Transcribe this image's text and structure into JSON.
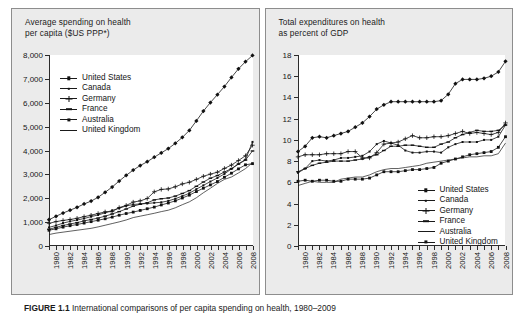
{
  "figure": {
    "caption_label": "FIGURE 1.1",
    "caption_text": "International comparisons of per capita spending on health, 1980–2009"
  },
  "panels": [
    {
      "id": "left",
      "title": "Average spending on health\nper capita ($US PPP*)"
    },
    {
      "id": "right",
      "title": "Total expenditures on health\nas percent of GDP"
    }
  ],
  "legend_entries": [
    "United States",
    "Canada",
    "Germany",
    "France",
    "Australia",
    "United Kingdom"
  ],
  "chart_data": [
    {
      "type": "line",
      "panel": "left",
      "title": "Average spending on health per capita ($US PPP*)",
      "xlabel": "",
      "ylabel": "",
      "xlim": [
        1980,
        2009
      ],
      "ylim": [
        0,
        8000
      ],
      "ytick_labels": [
        "0",
        "1,000",
        "2,000",
        "3,000",
        "4,000",
        "5,000",
        "6,000",
        "7,000",
        "8,000"
      ],
      "ytick_values": [
        0,
        1000,
        2000,
        3000,
        4000,
        5000,
        6000,
        7000,
        8000
      ],
      "xtick_labels": [
        "1980",
        "1982",
        "1984",
        "1986",
        "1988",
        "1990",
        "1992",
        "1994",
        "1996",
        "1998",
        "2000",
        "2002",
        "2004",
        "2006",
        "2008"
      ],
      "xtick_values": [
        1980,
        1982,
        1984,
        1986,
        1988,
        1990,
        1992,
        1994,
        1996,
        1998,
        2000,
        2002,
        2004,
        2006,
        2008
      ],
      "grid": false,
      "legend_position": "upper-left",
      "x": [
        1980,
        1981,
        1982,
        1983,
        1984,
        1985,
        1986,
        1987,
        1988,
        1989,
        1990,
        1991,
        1992,
        1993,
        1994,
        1995,
        1996,
        1997,
        1998,
        1999,
        2000,
        2001,
        2002,
        2003,
        2004,
        2005,
        2006,
        2007,
        2008,
        2009
      ],
      "series": [
        {
          "name": "United States",
          "marker": "diamond",
          "values": [
            1102,
            1245,
            1380,
            1500,
            1620,
            1760,
            1880,
            2040,
            2250,
            2470,
            2720,
            2960,
            3180,
            3370,
            3530,
            3720,
            3900,
            4080,
            4300,
            4550,
            4840,
            5240,
            5650,
            6010,
            6340,
            6680,
            7060,
            7420,
            7720,
            7980
          ]
        },
        {
          "name": "Canada",
          "marker": "small-square",
          "values": [
            780,
            860,
            960,
            1030,
            1090,
            1150,
            1230,
            1300,
            1390,
            1490,
            1580,
            1680,
            1740,
            1760,
            1780,
            1810,
            1830,
            1890,
            1980,
            2090,
            2210,
            2380,
            2540,
            2700,
            2850,
            3020,
            3230,
            3440,
            3620,
            4360
          ]
        },
        {
          "name": "Germany",
          "marker": "plus",
          "values": [
            950,
            1020,
            1070,
            1110,
            1160,
            1230,
            1290,
            1360,
            1430,
            1440,
            1610,
            1700,
            1840,
            1890,
            1990,
            2270,
            2370,
            2390,
            2480,
            2600,
            2670,
            2790,
            2920,
            3010,
            3090,
            3250,
            3390,
            3580,
            3780,
            4220
          ]
        },
        {
          "name": "France",
          "marker": "dash",
          "values": [
            700,
            780,
            860,
            920,
            980,
            1050,
            1110,
            1170,
            1250,
            1340,
            1440,
            1550,
            1670,
            1750,
            1810,
            1930,
            1980,
            2010,
            2090,
            2200,
            2320,
            2500,
            2680,
            2840,
            2950,
            3100,
            3240,
            3430,
            3600,
            3980
          ]
        },
        {
          "name": "Australia",
          "marker": "square",
          "values": [
            660,
            720,
            790,
            850,
            900,
            960,
            1020,
            1080,
            1140,
            1210,
            1290,
            1360,
            1420,
            1490,
            1560,
            1630,
            1720,
            1800,
            1890,
            2010,
            2130,
            2280,
            2420,
            2560,
            2700,
            2880,
            3050,
            3230,
            3400,
            3450
          ]
        },
        {
          "name": "United Kingdom",
          "marker": "line",
          "values": [
            480,
            540,
            580,
            620,
            660,
            700,
            740,
            800,
            870,
            940,
            1010,
            1090,
            1190,
            1250,
            1310,
            1370,
            1440,
            1500,
            1600,
            1730,
            1850,
            2020,
            2230,
            2420,
            2620,
            2790,
            2890,
            3060,
            3240,
            3490
          ]
        }
      ]
    },
    {
      "type": "line",
      "panel": "right",
      "title": "Total expenditures on health as percent of GDP",
      "xlabel": "",
      "ylabel": "",
      "xlim": [
        1980,
        2009
      ],
      "ylim": [
        0,
        18
      ],
      "ytick_labels": [
        "0",
        "2",
        "4",
        "6",
        "8",
        "10",
        "12",
        "14",
        "16",
        "18"
      ],
      "ytick_values": [
        0,
        2,
        4,
        6,
        8,
        10,
        12,
        14,
        16,
        18
      ],
      "xtick_labels": [
        "1980",
        "1982",
        "1984",
        "1986",
        "1988",
        "1990",
        "1992",
        "1994",
        "1996",
        "1998",
        "2000",
        "2002",
        "2004",
        "2006",
        "2008"
      ],
      "xtick_values": [
        1980,
        1982,
        1984,
        1986,
        1988,
        1990,
        1992,
        1994,
        1996,
        1998,
        2000,
        2002,
        2004,
        2006,
        2008
      ],
      "grid": false,
      "legend_position": "lower-right",
      "x": [
        1980,
        1981,
        1982,
        1983,
        1984,
        1985,
        1986,
        1987,
        1988,
        1989,
        1990,
        1991,
        1992,
        1993,
        1994,
        1995,
        1996,
        1997,
        1998,
        1999,
        2000,
        2001,
        2002,
        2003,
        2004,
        2005,
        2006,
        2007,
        2008,
        2009
      ],
      "series": [
        {
          "name": "United States",
          "marker": "diamond",
          "values": [
            8.9,
            9.4,
            10.2,
            10.3,
            10.2,
            10.4,
            10.6,
            10.8,
            11.2,
            11.6,
            12.2,
            12.9,
            13.3,
            13.6,
            13.6,
            13.6,
            13.6,
            13.6,
            13.6,
            13.6,
            13.7,
            14.3,
            15.3,
            15.7,
            15.7,
            15.7,
            15.8,
            16.0,
            16.4,
            17.4
          ]
        },
        {
          "name": "Canada",
          "marker": "small-square",
          "values": [
            6.9,
            7.3,
            8.0,
            8.1,
            8.0,
            8.1,
            8.3,
            8.3,
            8.4,
            8.5,
            8.9,
            9.6,
            9.9,
            9.7,
            9.5,
            9.0,
            8.8,
            8.8,
            8.9,
            8.9,
            8.8,
            9.3,
            9.6,
            9.8,
            9.8,
            9.8,
            10.0,
            10.0,
            10.3,
            11.4
          ]
        },
        {
          "name": "Germany",
          "marker": "plus",
          "values": [
            8.4,
            8.6,
            8.6,
            8.6,
            8.7,
            8.7,
            8.7,
            8.9,
            8.9,
            8.3,
            8.3,
            8.8,
            9.6,
            9.7,
            9.8,
            10.1,
            10.4,
            10.2,
            10.2,
            10.3,
            10.3,
            10.4,
            10.6,
            10.8,
            10.6,
            10.7,
            10.6,
            10.5,
            10.7,
            11.6
          ]
        },
        {
          "name": "France",
          "marker": "dash",
          "values": [
            7.0,
            7.3,
            7.6,
            7.8,
            7.9,
            8.0,
            8.0,
            8.0,
            8.1,
            8.2,
            8.4,
            8.6,
            9.0,
            9.4,
            9.4,
            9.5,
            9.5,
            9.4,
            9.3,
            9.3,
            9.6,
            9.8,
            10.2,
            10.5,
            10.7,
            10.9,
            10.8,
            10.8,
            10.9,
            11.4
          ]
        },
        {
          "name": "Australia",
          "marker": "line",
          "values": [
            5.7,
            5.9,
            6.1,
            6.0,
            6.0,
            6.0,
            6.3,
            6.4,
            6.5,
            6.5,
            6.7,
            7.0,
            7.2,
            7.3,
            7.3,
            7.4,
            7.5,
            7.6,
            7.8,
            7.9,
            8.0,
            8.1,
            8.2,
            8.3,
            8.4,
            8.4,
            8.5,
            8.5,
            8.7,
            9.7
          ]
        },
        {
          "name": "United Kingdom",
          "marker": "square",
          "values": [
            6.1,
            6.2,
            6.1,
            6.2,
            6.2,
            6.1,
            6.1,
            6.3,
            6.3,
            6.3,
            6.4,
            6.7,
            7.0,
            7.0,
            7.0,
            7.1,
            7.2,
            7.2,
            7.3,
            7.4,
            7.8,
            8.0,
            8.2,
            8.4,
            8.6,
            8.7,
            8.8,
            8.9,
            9.3,
            10.3
          ]
        }
      ]
    }
  ]
}
